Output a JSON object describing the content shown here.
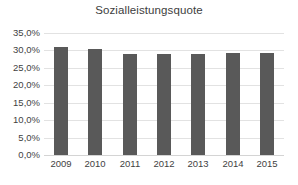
{
  "chart_data": {
    "type": "bar",
    "title": "Sozialleistungsquote",
    "xlabel": "",
    "ylabel": "",
    "categories": [
      "2009",
      "2010",
      "2011",
      "2012",
      "2013",
      "2014",
      "2015"
    ],
    "values": [
      30.9,
      30.3,
      28.9,
      28.9,
      29.0,
      29.2,
      29.2
    ],
    "ylim": [
      0,
      35
    ],
    "ytick_values": [
      35,
      30,
      25,
      20,
      15,
      10,
      5,
      0
    ],
    "ytick_labels": [
      "35,0%",
      "30,0%",
      "25,0%",
      "20,0%",
      "15,0%",
      "10,0%",
      "5,0%",
      "0,0%"
    ],
    "grid": true,
    "legend": false,
    "legend_position": "none",
    "bar_color": "#595959",
    "gridline_color": "#e2e2e2",
    "background_color": "#ffffff",
    "text_color": "#3f3f3f"
  }
}
